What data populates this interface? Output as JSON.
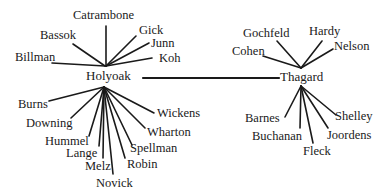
{
  "diagram": {
    "type": "two-hub network of co-authors/colleagues",
    "hubs": [
      {
        "id": "holyoak",
        "label": "Holyoak",
        "x": 86,
        "y": 69
      },
      {
        "id": "thagard",
        "label": "Thagard",
        "x": 280,
        "y": 70
      }
    ],
    "hub_connection": {
      "from": "holyoak",
      "to": "thagard",
      "x1": 143,
      "y1": 78,
      "x2": 279,
      "y2": 78
    },
    "holyoak_top": [
      {
        "label": "Catrambone",
        "lx": 73,
        "ly": 9,
        "x1": 106,
        "y1": 26,
        "x2": 106,
        "y2": 66
      },
      {
        "label": "Bassok",
        "lx": 40,
        "ly": 29,
        "x1": 73,
        "y1": 44,
        "x2": 105,
        "y2": 66
      },
      {
        "label": "Billman",
        "lx": 15,
        "ly": 51,
        "x1": 52,
        "y1": 63,
        "x2": 105,
        "y2": 66
      },
      {
        "label": "Gick",
        "lx": 139,
        "ly": 24,
        "x1": 136,
        "y1": 36,
        "x2": 106,
        "y2": 66
      },
      {
        "label": "Junn",
        "lx": 151,
        "ly": 37,
        "x1": 149,
        "y1": 43,
        "x2": 106,
        "y2": 66
      },
      {
        "label": "Koh",
        "lx": 159,
        "ly": 52,
        "x1": 152,
        "y1": 58,
        "x2": 106,
        "y2": 66
      }
    ],
    "holyoak_bottom": [
      {
        "label": "Burns",
        "lx": 18,
        "ly": 98,
        "x1": 49,
        "y1": 101,
        "x2": 104,
        "y2": 87
      },
      {
        "label": "Downing",
        "lx": 26,
        "ly": 117,
        "x1": 71,
        "y1": 118,
        "x2": 104,
        "y2": 87
      },
      {
        "label": "Hummel",
        "lx": 45,
        "ly": 135,
        "x1": 89,
        "y1": 136,
        "x2": 104,
        "y2": 87
      },
      {
        "label": "Lange",
        "lx": 66,
        "ly": 147,
        "x1": 99,
        "y1": 146,
        "x2": 104,
        "y2": 87
      },
      {
        "label": "Melz",
        "lx": 85,
        "ly": 160,
        "x1": 103,
        "y1": 158,
        "x2": 104,
        "y2": 87
      },
      {
        "label": "Novick",
        "lx": 96,
        "ly": 177,
        "x1": 113,
        "y1": 174,
        "x2": 104,
        "y2": 87
      },
      {
        "label": "Robin",
        "lx": 127,
        "ly": 158,
        "x1": 125,
        "y1": 158,
        "x2": 104,
        "y2": 87
      },
      {
        "label": "Spellman",
        "lx": 130,
        "ly": 142,
        "x1": 132,
        "y1": 145,
        "x2": 104,
        "y2": 87
      },
      {
        "label": "Wharton",
        "lx": 147,
        "ly": 126,
        "x1": 145,
        "y1": 128,
        "x2": 104,
        "y2": 87
      },
      {
        "label": "Wickens",
        "lx": 157,
        "ly": 107,
        "x1": 154,
        "y1": 113,
        "x2": 104,
        "y2": 87
      }
    ],
    "thagard_top": [
      {
        "label": "Gochfeld",
        "lx": 243,
        "ly": 27,
        "x1": 277,
        "y1": 41,
        "x2": 301,
        "y2": 68
      },
      {
        "label": "Hardy",
        "lx": 309,
        "ly": 25,
        "x1": 322,
        "y1": 41,
        "x2": 301,
        "y2": 68
      },
      {
        "label": "Nelson",
        "lx": 334,
        "ly": 40,
        "x1": 333,
        "y1": 49,
        "x2": 301,
        "y2": 68
      },
      {
        "label": "Cohen",
        "lx": 232,
        "ly": 45,
        "x1": 263,
        "y1": 56,
        "x2": 301,
        "y2": 68
      }
    ],
    "thagard_bottom": [
      {
        "label": "Barnes",
        "lx": 245,
        "ly": 112,
        "x1": 285,
        "y1": 117,
        "x2": 301,
        "y2": 86
      },
      {
        "label": "Buchanan",
        "lx": 252,
        "ly": 130,
        "x1": 300,
        "y1": 128,
        "x2": 301,
        "y2": 86
      },
      {
        "label": "Fleck",
        "lx": 303,
        "ly": 145,
        "x1": 313,
        "y1": 143,
        "x2": 301,
        "y2": 86
      },
      {
        "label": "Joordens",
        "lx": 327,
        "ly": 129,
        "x1": 328,
        "y1": 128,
        "x2": 301,
        "y2": 86
      },
      {
        "label": "Shelley",
        "lx": 335,
        "ly": 110,
        "x1": 336,
        "y1": 115,
        "x2": 301,
        "y2": 86
      }
    ],
    "colors": {
      "line": "#1a1a1a",
      "text": "#1a1a1a",
      "background": "#ffffff"
    }
  }
}
